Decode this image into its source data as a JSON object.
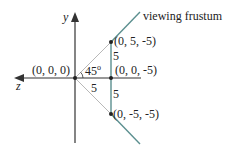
{
  "diagram": {
    "title_label": "viewing frustum",
    "axes": {
      "y_label": "y",
      "z_label": "z"
    },
    "points": [
      {
        "label": "(0, 0, 0)",
        "role": "origin"
      },
      {
        "label": "(0, 5, -5)",
        "role": "top"
      },
      {
        "label": "(0, 0, -5)",
        "role": "center"
      },
      {
        "label": "(0, -5, -5)",
        "role": "bottom"
      }
    ],
    "angle_label": "45",
    "angle_degree_mark": "o",
    "distance_labels": {
      "horizontal": "5",
      "upper_vertical": "5",
      "lower_vertical": "5"
    },
    "colors": {
      "axis": "#333333",
      "frustum": "#5b8f8f",
      "guide": "#b8b8b8",
      "point": "#222222",
      "text": "#222222"
    }
  }
}
